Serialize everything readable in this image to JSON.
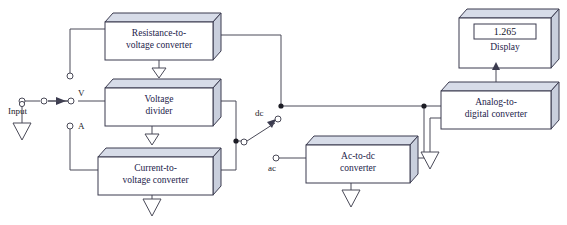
{
  "diagram": {
    "colors": {
      "box_face": "#ffffff",
      "box_top": "#d7dce8",
      "box_side": "#c9cfdd",
      "line": "#4a4a58",
      "text": "#23234a",
      "background": "#ffffff"
    },
    "blocks": [
      {
        "id": "resistance_to_voltage",
        "label": "Resistance-to-\nvoltage converter"
      },
      {
        "id": "voltage_divider",
        "label": "Voltage\ndivider"
      },
      {
        "id": "current_to_voltage",
        "label": "Current-to-\nvoltage converter"
      },
      {
        "id": "ac_to_dc",
        "label": "Ac-to-dc\nconverter"
      },
      {
        "id": "analog_to_digital",
        "label": "Analog-to-\ndigital converter"
      },
      {
        "id": "display",
        "label": "Display"
      }
    ],
    "display": {
      "reading": "1.265",
      "caption": "Display"
    },
    "terminals": [
      {
        "id": "input",
        "label": "Input"
      },
      {
        "id": "volts",
        "label": "V"
      },
      {
        "id": "amps",
        "label": "A"
      },
      {
        "id": "dc",
        "label": "dc"
      },
      {
        "id": "ac",
        "label": "ac"
      }
    ]
  }
}
